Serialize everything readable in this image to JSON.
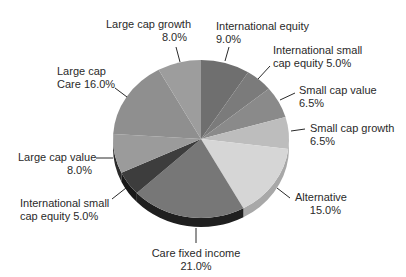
{
  "chart_data": {
    "type": "pie",
    "style": "3d",
    "title": "",
    "unit": "%",
    "start": "top",
    "direction": "clockwise",
    "slices": [
      {
        "name": "International equity",
        "label_lines": [
          "International equity",
          "9.0%"
        ],
        "value": 9.0,
        "color": "#6f6f6f",
        "side_color": "#4a4a4a"
      },
      {
        "name": "International small cap equity",
        "label_lines": [
          "International small",
          "cap equity 5.0%"
        ],
        "value": 5.0,
        "color": "#7b7b7b",
        "side_color": "#555555"
      },
      {
        "name": "Small cap value",
        "label_lines": [
          "Small cap value",
          "6.5%"
        ],
        "value": 6.5,
        "color": "#8a8a8a",
        "side_color": "#666666"
      },
      {
        "name": "Small cap growth",
        "label_lines": [
          "Small cap growth",
          "6.5%"
        ],
        "value": 6.5,
        "color": "#bdbdbd",
        "side_color": "#9a9a9a"
      },
      {
        "name": "Alternative",
        "label_lines": [
          "Alternative",
          "15.0%"
        ],
        "value": 15.0,
        "color": "#d6d6d6",
        "side_color": "#a8a8a8"
      },
      {
        "name": "Care fixed income",
        "label_lines": [
          "Care fixed income",
          "21.0%"
        ],
        "value": 21.0,
        "color": "#777777",
        "side_color": "#1f1f1f"
      },
      {
        "name": "International small cap equity",
        "label_lines": [
          "International small",
          "cap equity 5.0%"
        ],
        "value": 5.0,
        "color": "#3d3d3d",
        "side_color": "#181818"
      },
      {
        "name": "Large cap value",
        "label_lines": [
          "Large cap value",
          "8.0%"
        ],
        "value": 8.0,
        "color": "#9b9b9b",
        "side_color": "#2a2a2a"
      },
      {
        "name": "Large cap Care",
        "label_lines": [
          "Large cap",
          "Care 16.0%"
        ],
        "value": 16.0,
        "color": "#8f8f8f",
        "side_color": "#555555"
      },
      {
        "name": "Large cap growth",
        "label_lines": [
          "Large cap growth",
          "8.0%"
        ],
        "value": 8.0,
        "color": "#9d9d9d",
        "side_color": "#6a6a6a"
      }
    ],
    "legend": "none"
  }
}
